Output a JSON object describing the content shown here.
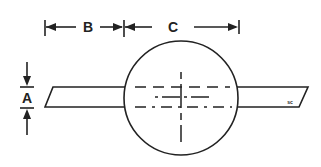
{
  "diagram": {
    "type": "technical-dimension-drawing",
    "labels": {
      "dim_a": "A",
      "dim_b": "B",
      "dim_c": "C",
      "corner_mark": "sc"
    },
    "colors": {
      "stroke": "#222222",
      "background": "#ffffff"
    },
    "dimensions": [
      {
        "name": "A",
        "description": "thickness of bar (vertical)"
      },
      {
        "name": "B",
        "description": "horizontal distance from bar left end to circle left edge"
      },
      {
        "name": "C",
        "description": "diameter of circle"
      }
    ]
  }
}
